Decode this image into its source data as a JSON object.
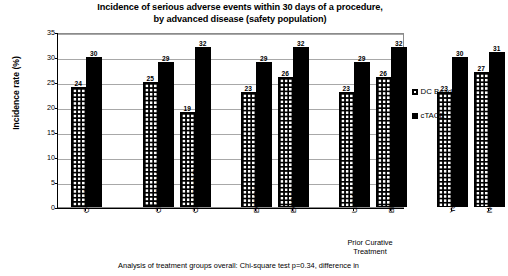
{
  "chart_data": {
    "type": "bar",
    "title": "Incidence of serious adverse events within 30 days of a procedure, by advanced disease (safety population)",
    "title_lines": [
      "Incidence of serious adverse events within 30 days of a procedure,",
      "by advanced disease (safety population)"
    ],
    "xlabel": "",
    "ylabel": "Incidence rate (%)",
    "ylim": [
      0,
      35
    ],
    "ytick_labels": [
      "0",
      "5",
      "10",
      "15",
      "20",
      "25",
      "30",
      "35"
    ],
    "ytick_values": [
      0,
      5,
      10,
      15,
      20,
      25,
      30,
      35
    ],
    "grid": true,
    "legend_position": "right",
    "categories": [
      "Overall",
      "Child-Pugh A",
      "Child-Pugh B",
      "ECOG 0",
      "ECOG 1",
      "Unilobar",
      "Bilobar",
      "Yes",
      "No"
    ],
    "group_labels": [
      {
        "text_lines": [
          "Prior Curative",
          "Treatment"
        ],
        "covers": [
          "Yes",
          "No"
        ]
      }
    ],
    "series": [
      {
        "name": "DC Bead",
        "pattern": "checkered",
        "color": "#000000",
        "values": [
          24,
          25,
          19,
          23,
          26,
          23,
          26,
          23,
          27
        ]
      },
      {
        "name": "cTACE",
        "pattern": "solid",
        "color": "#000000",
        "values": [
          30,
          29,
          32,
          29,
          32,
          29,
          32,
          30,
          31
        ]
      }
    ]
  },
  "footer": {
    "note": "Analysis of treatment groups overall: Chi-square test p=0.34, difference in"
  }
}
